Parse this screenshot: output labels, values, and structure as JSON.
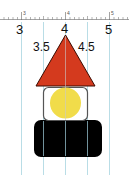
{
  "ruler": {
    "tiny_labels": [
      "3",
      "4",
      "5"
    ],
    "major_labels": [
      "3",
      "4",
      "5"
    ],
    "range": [
      2.5,
      5.5
    ]
  },
  "annotations": {
    "left_label": "3.5",
    "right_label": "4.5"
  },
  "shapes": {
    "triangle": {
      "fill": "#d43a1e",
      "stroke": "#3a0a00"
    },
    "circle": {
      "fill": "#f1dc4a"
    },
    "outline_box": {
      "stroke": "#555555"
    },
    "black_box": {
      "fill": "#000000"
    }
  },
  "grid": {
    "color": "#a9d6e0",
    "positions": [
      3,
      3.5,
      4,
      4.5,
      5
    ]
  }
}
